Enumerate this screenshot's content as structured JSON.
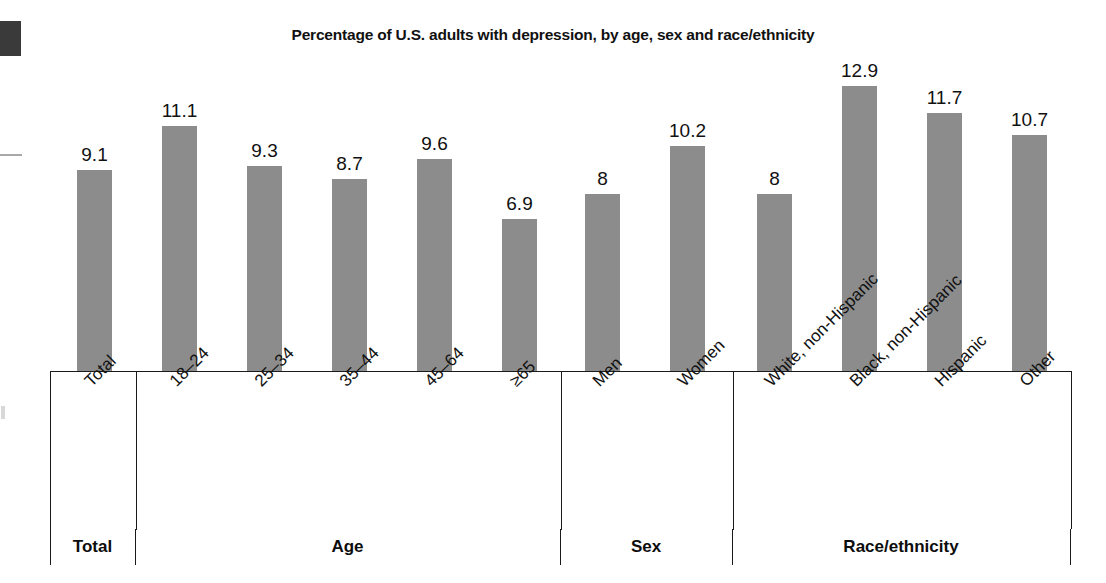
{
  "chart_data": {
    "type": "bar",
    "title": "Percentage of U.S. adults with depression, by age, sex and race/ethnicity",
    "xlabel": "",
    "ylabel": "",
    "ylim": [
      0,
      14
    ],
    "grid": false,
    "legend": "none",
    "bar_color": "#8c8c8c",
    "categories": [
      "Total",
      "18–24",
      "25–34",
      "35–44",
      "45–64",
      "≥65",
      "Men",
      "Women",
      "White, non-Hispanic",
      "Black, non-Hispanic",
      "Hispanic",
      "Other"
    ],
    "values": [
      9.1,
      11.1,
      9.3,
      8.7,
      9.6,
      6.9,
      8,
      10.2,
      8,
      12.9,
      11.7,
      10.7
    ],
    "value_labels": [
      "9.1",
      "11.1",
      "9.3",
      "8.7",
      "9.6",
      "6.9",
      "8",
      "10.2",
      "8",
      "12.9",
      "11.7",
      "10.7"
    ],
    "groups": [
      {
        "label": "Total",
        "categories": [
          "Total"
        ]
      },
      {
        "label": "Age",
        "categories": [
          "18–24",
          "25–34",
          "35–44",
          "45–64",
          "≥65"
        ]
      },
      {
        "label": "Sex",
        "categories": [
          "Men",
          "Women"
        ]
      },
      {
        "label": "Race/ethnicity",
        "categories": [
          "White, non-Hispanic",
          "Black, non-Hispanic",
          "Hispanic",
          "Other"
        ]
      }
    ]
  },
  "figure": {
    "title": "Percentage of U.S. adults with depression, by age, sex and race/ethnicity",
    "group_labels": [
      "Total",
      "Age",
      "Sex",
      "Race/ethnicity"
    ]
  }
}
